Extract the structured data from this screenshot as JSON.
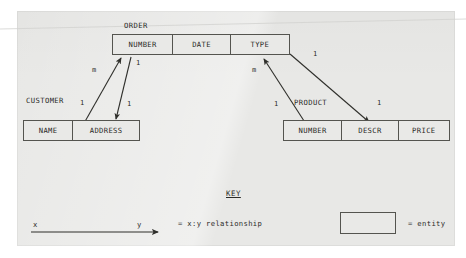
{
  "diagram": {
    "entities": [
      {
        "name": "ORDER",
        "attributes": [
          "NUMBER",
          "DATE",
          "TYPE"
        ]
      },
      {
        "name": "CUSTOMER",
        "attributes": [
          "NAME",
          "ADDRESS"
        ]
      },
      {
        "name": "PRODUCT",
        "attributes": [
          "NUMBER",
          "DESCR",
          "PRICE"
        ]
      }
    ],
    "relationships": [
      {
        "from": "CUSTOMER.ADDRESS",
        "to": "ORDER.NUMBER",
        "from_cardinality": "1",
        "to_cardinality": "m"
      },
      {
        "from": "ORDER.NUMBER",
        "to": "CUSTOMER.ADDRESS",
        "from_cardinality": "1",
        "to_cardinality": "1"
      },
      {
        "from": "PRODUCT.NUMBER",
        "to": "ORDER.TYPE",
        "from_cardinality": "1",
        "to_cardinality": "m"
      },
      {
        "from": "ORDER.TYPE",
        "to": "PRODUCT.DESCR",
        "from_cardinality": "1",
        "to_cardinality": "1"
      }
    ],
    "cardinality_labels": {
      "order_number_m": "m",
      "order_number_1": "1",
      "customer_1": "1",
      "address_1": "1",
      "order_type_m": "m",
      "order_type_1": "1",
      "product_1": "1",
      "descr_1": "1"
    }
  },
  "key": {
    "title": "KEY",
    "arrow_from_label": "x",
    "arrow_to_label": "y",
    "relationship_text": "= x:y relationship",
    "entity_text": "= entity"
  },
  "colors": {
    "ink": "#2b2b28",
    "line": "#54544f",
    "paper": "#e8e8e6"
  }
}
